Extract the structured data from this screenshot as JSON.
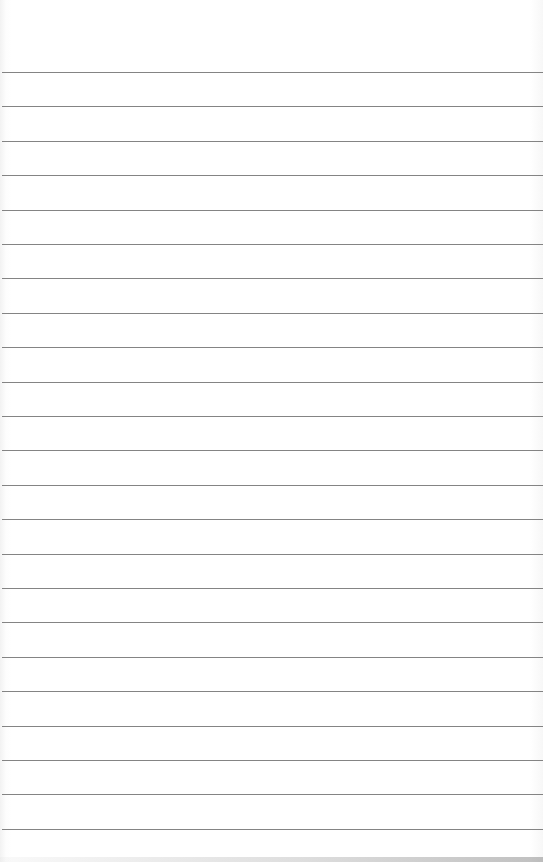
{
  "page": {
    "type": "ruled-paper",
    "background_color": "#ffffff",
    "line_color": "#6e6e6e",
    "first_line_y": 72,
    "line_spacing": 34.4,
    "line_count": 23
  }
}
